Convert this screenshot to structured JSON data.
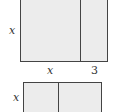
{
  "diagram": {
    "top_rectangle": {
      "side_label": "x",
      "bottom_labels": [
        "x",
        "3"
      ]
    },
    "bottom_rectangle": {
      "side_label": "x"
    },
    "colors": {
      "fill": "#ececec",
      "stroke": "#444444"
    }
  }
}
